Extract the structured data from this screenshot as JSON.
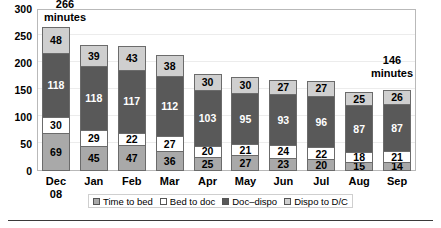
{
  "chart_data": {
    "type": "bar",
    "subtype": "stacked-bar",
    "title": "",
    "xlabel": "",
    "ylabel": "",
    "ylim": [
      0,
      300
    ],
    "yticks": [
      0,
      50,
      100,
      150,
      200,
      250,
      300
    ],
    "grid": true,
    "legend_position": "bottom",
    "categories": [
      "Dec\n08",
      "Jan",
      "Feb",
      "Mar",
      "Apr",
      "May",
      "Jun",
      "Jul",
      "Aug",
      "Sep"
    ],
    "series": [
      {
        "name": "Time to bed",
        "color": "#a9a9a9",
        "values": [
          69,
          45,
          47,
          36,
          25,
          27,
          23,
          20,
          15,
          14
        ]
      },
      {
        "name": "Bed to doc",
        "color": "#ffffff",
        "values": [
          30,
          29,
          22,
          27,
          20,
          21,
          24,
          22,
          18,
          21
        ]
      },
      {
        "name": "Doc-dispo",
        "color": "#595959",
        "values": [
          118,
          118,
          117,
          112,
          103,
          95,
          93,
          96,
          87,
          87
        ]
      },
      {
        "name": "Dispo to D/C",
        "color": "#cfcfcf",
        "values": [
          48,
          39,
          43,
          38,
          30,
          30,
          27,
          27,
          25,
          26
        ]
      }
    ],
    "annotations": [
      {
        "text": "266\nminutes",
        "category": "Dec 08",
        "value": 266
      },
      {
        "text": "146\nminutes",
        "category": "Sep",
        "value": 146
      }
    ]
  },
  "axes": {
    "y_tick_labels": [
      "0",
      "50",
      "100",
      "150",
      "200",
      "250",
      "300"
    ],
    "x_tick_labels": [
      "Dec\n08",
      "Jan",
      "Feb",
      "Mar",
      "Apr",
      "May",
      "Jun",
      "Jul",
      "Aug",
      "Sep"
    ]
  },
  "legend": {
    "items": [
      {
        "label": "Time to bed",
        "swatch": "#a9a9a9"
      },
      {
        "label": "Bed to doc",
        "swatch": "#ffffff"
      },
      {
        "label": "Doc–dispo",
        "swatch": "#595959"
      },
      {
        "label": "Dispo to D/C",
        "swatch": "#cfcfcf"
      }
    ]
  },
  "annotations": {
    "left": "266\nminutes",
    "right": "146\nminutes"
  }
}
